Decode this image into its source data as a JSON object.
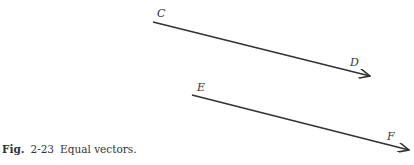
{
  "caption": {
    "prefix": "Fig.",
    "number": "2-23",
    "text": "Equal vectors."
  },
  "vectors": [
    {
      "name": "CD",
      "start_label": "C",
      "end_label": "D",
      "start": [
        153,
        22
      ],
      "end": [
        370,
        76
      ]
    },
    {
      "name": "EF",
      "start_label": "E",
      "end_label": "F",
      "start": [
        192,
        95
      ],
      "end": [
        409,
        150
      ]
    }
  ],
  "colors": {
    "line": "#333333"
  }
}
